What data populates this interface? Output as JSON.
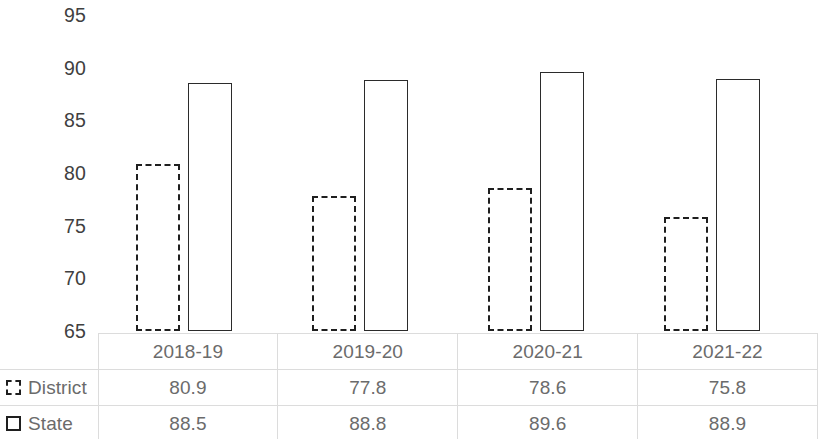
{
  "chart_data": {
    "type": "bar",
    "title": "",
    "subtitle": "",
    "xlabel": "",
    "ylabel": "",
    "categories": [
      "2018-19",
      "2019-20",
      "2020-21",
      "2021-22"
    ],
    "series": [
      {
        "name": "District",
        "values": [
          80.9,
          77.8,
          78.6,
          75.8
        ],
        "style": "dashed-outline"
      },
      {
        "name": "State",
        "values": [
          88.5,
          88.8,
          89.6,
          88.9
        ],
        "style": "solid-outline"
      }
    ],
    "ylim": [
      65,
      95
    ],
    "yticks": [
      95,
      90,
      85,
      80,
      75,
      70,
      65
    ],
    "ytick_labels": [
      "95",
      "90",
      "85",
      "80",
      "75",
      "70",
      "65"
    ],
    "grid": false,
    "legend_position": "data-table-left",
    "data_table": true
  },
  "axis": {
    "ticks": [
      {
        "label": "95",
        "value": 95
      },
      {
        "label": "90",
        "value": 90
      },
      {
        "label": "85",
        "value": 85
      },
      {
        "label": "80",
        "value": 80
      },
      {
        "label": "75",
        "value": 75
      },
      {
        "label": "70",
        "value": 70
      },
      {
        "label": "65",
        "value": 65
      }
    ]
  },
  "table": {
    "column_headers": [
      "",
      "2018-19",
      "2019-20",
      "2020-21",
      "2021-22"
    ],
    "rows": [
      {
        "legend": "District",
        "marker": "dashed-square",
        "cells": [
          "80.9",
          "77.8",
          "78.6",
          "75.8"
        ]
      },
      {
        "legend": "State",
        "marker": "solid-square",
        "cells": [
          "88.5",
          "88.8",
          "89.6",
          "88.9"
        ]
      }
    ]
  },
  "colors": {
    "bar_outline": "#2b2b2b",
    "text": "#6b6b6b",
    "axis_text": "#404040",
    "grid_line": "#dcdcdc",
    "background": "#ffffff"
  }
}
